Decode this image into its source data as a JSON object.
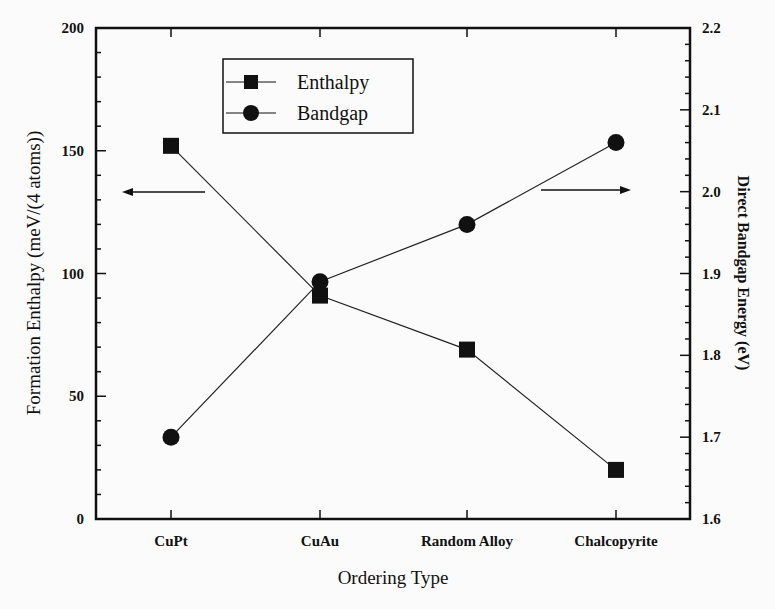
{
  "chart_data": {
    "type": "line",
    "title": "",
    "xlabel": "Ordering Type",
    "ylabel": "Formation Enthalpy (meV/(4 atoms))",
    "y2label": "Direct Bandgap Energy (eV)",
    "categories": [
      "CuPt",
      "CuAu",
      "Random Alloy",
      "Chalcopyrite"
    ],
    "ylim": [
      0,
      200
    ],
    "y2lim": [
      1.6,
      2.2
    ],
    "yticks": [
      "0",
      "50",
      "100",
      "150",
      "200"
    ],
    "y2ticks": [
      "1.6",
      "1.7",
      "1.8",
      "1.9",
      "2.0",
      "2.1",
      "2.2"
    ],
    "grid": false,
    "legend_position": "upper-left-inside",
    "series": [
      {
        "name": "Enthalpy",
        "axis": "left",
        "marker": "square",
        "values": [
          152,
          91,
          69,
          20
        ]
      },
      {
        "name": "Bandgap",
        "axis": "right",
        "marker": "circle",
        "values": [
          1.7,
          1.89,
          1.96,
          2.06
        ]
      }
    ],
    "annotations": [
      {
        "type": "arrow",
        "direction": "left",
        "meaning": "Enthalpy uses left axis"
      },
      {
        "type": "arrow",
        "direction": "right",
        "meaning": "Bandgap uses right axis"
      }
    ]
  }
}
